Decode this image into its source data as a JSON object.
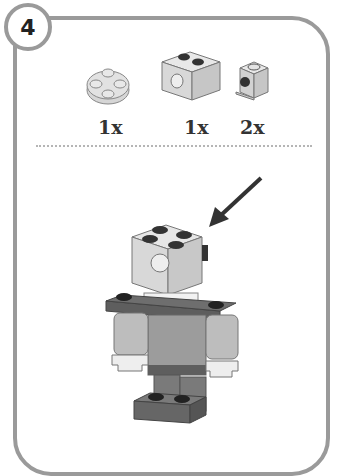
{
  "step": {
    "number": "4"
  },
  "parts": [
    {
      "name": "round-plate-2x2",
      "quantity": "1x"
    },
    {
      "name": "technic-brick-1x2-with-hole",
      "quantity": "1x"
    },
    {
      "name": "brick-1x1-with-side-stud",
      "quantity": "2x"
    }
  ],
  "colors": {
    "frame": "#9a9a9a",
    "light_gray": "#d6d6d6",
    "mid_gray": "#9c9c9c",
    "dark_gray": "#5e5e5e",
    "black": "#222222"
  }
}
